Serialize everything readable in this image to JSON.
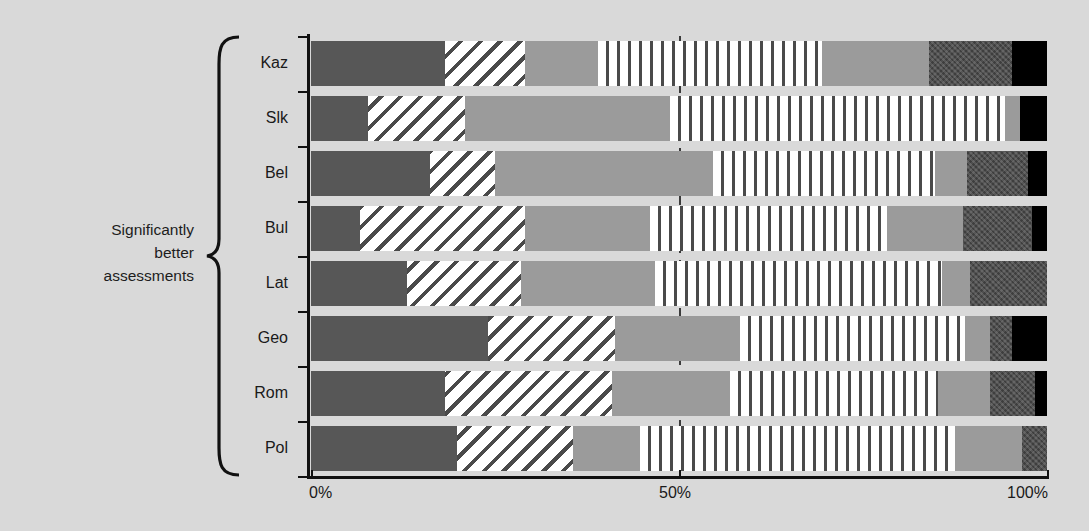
{
  "group_annotation": {
    "text": "Significantly\nbetter\nassessments",
    "brace_icon": "curly-brace-icon"
  },
  "axis": {
    "ticks": [
      {
        "label": "0%",
        "value": 0
      },
      {
        "label": "50%",
        "value": 50
      },
      {
        "label": "100%",
        "value": 100
      }
    ],
    "gridline_value": 50
  },
  "colors": {
    "dark_gray": "#575757",
    "mid_gray": "#9b9b9b",
    "dark_textured": "#4f4f4f",
    "black": "#000000",
    "background": "#d9d9d9",
    "axis": "#111111"
  },
  "chart_data": {
    "type": "bar",
    "orientation": "horizontal",
    "stacked": true,
    "normalized": true,
    "title": "",
    "xlabel": "",
    "ylabel": "",
    "xlim": [
      0,
      100
    ],
    "grid": true,
    "gridlines": [
      50
    ],
    "legend_position": "none",
    "categories": [
      "Kaz",
      "Slk",
      "Bel",
      "Bul",
      "Lat",
      "Geo",
      "Rom",
      "Pol"
    ],
    "series": [
      {
        "name": "segment-1",
        "style": "dark-gray",
        "values": [
          18.2,
          7.7,
          16.2,
          6.7,
          13.0,
          24.0,
          18.2,
          19.8
        ]
      },
      {
        "name": "segment-2",
        "style": "diagonal-hatch",
        "values": [
          10.9,
          13.2,
          8.8,
          22.4,
          15.6,
          17.3,
          22.7,
          15.8
        ]
      },
      {
        "name": "segment-3",
        "style": "mid-gray",
        "values": [
          9.9,
          27.9,
          29.6,
          17.0,
          18.1,
          17.0,
          16.0,
          9.1
        ]
      },
      {
        "name": "segment-4",
        "style": "vertical-stripe",
        "values": [
          30.4,
          45.5,
          30.2,
          32.2,
          39.0,
          30.6,
          28.3,
          42.8
        ]
      },
      {
        "name": "segment-5",
        "style": "mid-gray",
        "values": [
          14.5,
          2.0,
          4.3,
          10.3,
          3.8,
          3.4,
          7.1,
          9.1
        ]
      },
      {
        "name": "segment-6",
        "style": "dark-textured",
        "values": [
          11.4,
          0.0,
          8.3,
          9.4,
          10.5,
          3.0,
          6.1,
          3.4
        ]
      },
      {
        "name": "segment-7",
        "style": "black",
        "values": [
          4.7,
          3.7,
          2.6,
          2.0,
          0.0,
          4.7,
          1.6,
          0.0
        ]
      }
    ]
  }
}
